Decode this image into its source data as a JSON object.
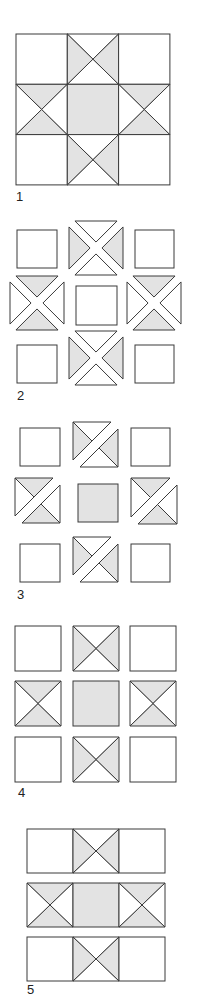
{
  "colors": {
    "stroke": "#3a3a3a",
    "shade": "#e3e3e3",
    "blank": "#ffffff"
  },
  "figures": [
    {
      "label": "1",
      "label_pos": [
        16,
        192
      ],
      "type": "assembled",
      "origin": [
        16,
        34
      ],
      "cell": [
        51.3,
        50.3
      ],
      "gap": [
        0,
        0
      ],
      "cells": [
        [
          "plain",
          "x-lr",
          "plain"
        ],
        [
          "x-tb",
          "solid",
          "x-tb"
        ],
        [
          "plain",
          "x-lr",
          "plain"
        ]
      ]
    },
    {
      "label": "2",
      "label_pos": [
        17,
        392
      ],
      "type": "exploded-quarters",
      "squares": [
        [
          17,
          230,
          40,
          38
        ],
        [
          135,
          230,
          39,
          38
        ],
        [
          76,
          286,
          41,
          39
        ],
        [
          17,
          345,
          40,
          38
        ],
        [
          135,
          345,
          39,
          38
        ]
      ],
      "blocks": [
        {
          "cx": 96,
          "cy": 248,
          "r": 27,
          "shade": "lr"
        },
        {
          "cx": 37,
          "cy": 303,
          "r": 27,
          "shade": "tb"
        },
        {
          "cx": 154,
          "cy": 303,
          "r": 27,
          "shade": "tb"
        },
        {
          "cx": 96,
          "cy": 358,
          "r": 27,
          "shade": "lr"
        }
      ]
    },
    {
      "label": "3",
      "label_pos": [
        17,
        590
      ],
      "type": "exploded-halves",
      "squares": [
        [
          20,
          428,
          40,
          38
        ],
        [
          131,
          428,
          39,
          38
        ],
        [
          20,
          544,
          40,
          38
        ],
        [
          131,
          544,
          39,
          38
        ]
      ],
      "solid": [
        [
          78,
          484,
          40,
          38
        ]
      ],
      "blocks": [
        {
          "x": 73,
          "y": 422,
          "s": 45,
          "shade": "lr"
        },
        {
          "x": 15,
          "y": 478,
          "s": 45,
          "shade": "tb"
        },
        {
          "x": 131,
          "y": 478,
          "s": 46,
          "shade": "tb"
        },
        {
          "x": 73,
          "y": 537,
          "s": 45,
          "shade": "lr"
        }
      ]
    },
    {
      "label": "4",
      "label_pos": [
        18,
        788
      ],
      "type": "separated",
      "cols": [
        15,
        73,
        130
      ],
      "rows": [
        626,
        681,
        737
      ],
      "size": [
        46,
        45
      ],
      "cells": [
        [
          "plain",
          "x-lr",
          "plain"
        ],
        [
          "x-tb",
          "solid",
          "x-tb"
        ],
        [
          "plain",
          "x-lr",
          "plain"
        ]
      ]
    },
    {
      "label": "5",
      "label_pos": [
        27,
        985
      ],
      "type": "rows",
      "origin_x": 27,
      "rows": [
        829,
        883,
        937
      ],
      "cell": [
        46,
        44
      ],
      "cells": [
        [
          "plain",
          "x-lr",
          "plain"
        ],
        [
          "x-tb",
          "solid",
          "x-tb"
        ],
        [
          "plain",
          "x-lr",
          "plain"
        ]
      ]
    }
  ]
}
